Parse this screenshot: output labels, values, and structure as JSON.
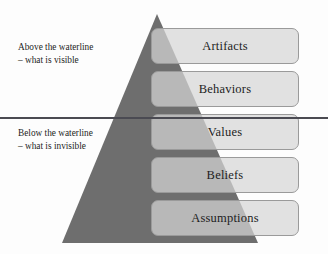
{
  "diagram": {
    "colors": {
      "background": "#fdfdfd",
      "pyramid_fill": "#6e6e6e",
      "box_fill": "#d6d6d6",
      "box_border": "#9a9a9a",
      "waterline": "#4a4a52",
      "text": "#1d1d1d"
    },
    "waterline": {
      "name": "waterline"
    },
    "notes": {
      "above": {
        "line1": "Above the waterline",
        "line2": "– what is visible"
      },
      "below": {
        "line1": "Below the waterline",
        "line2": "– what is invisible"
      }
    },
    "layers": [
      {
        "id": "artifacts",
        "label": "Artifacts",
        "position": "above"
      },
      {
        "id": "behaviors",
        "label": "Behaviors",
        "position": "above"
      },
      {
        "id": "values",
        "label": "Values",
        "position": "below"
      },
      {
        "id": "beliefs",
        "label": "Beliefs",
        "position": "below"
      },
      {
        "id": "assumptions",
        "label": "Assumptions",
        "position": "below"
      }
    ]
  }
}
